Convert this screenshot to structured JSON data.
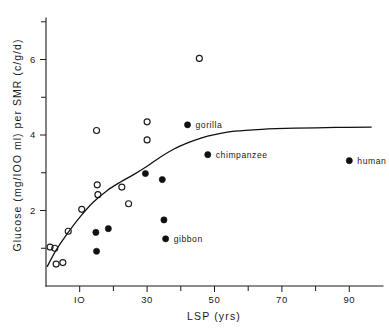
{
  "chart_data": {
    "type": "scatter",
    "title": "",
    "xlabel": "LSP (yrs)",
    "ylabel": "Glucose  (mg/IOO ml)  per SMR  (c/g/d)",
    "xlim": [
      0,
      100
    ],
    "ylim": [
      0,
      7.1
    ],
    "x_ticks_major": [
      10,
      30,
      50,
      70,
      90
    ],
    "x_ticks_major_labels": [
      "IO",
      "30",
      "50",
      "70",
      "90"
    ],
    "x_ticks_minor": [
      20,
      40,
      60,
      80
    ],
    "y_ticks_major": [
      2,
      4,
      6
    ],
    "y_ticks_major_labels": [
      "2",
      "4",
      "6"
    ],
    "y_ticks_minor": [
      1,
      3,
      5,
      7
    ],
    "grid": false,
    "legend_position": "none",
    "series": [
      {
        "name": "open-circle-species",
        "marker": "open-circle",
        "points": [
          {
            "x": 1.2,
            "y": 1.03
          },
          {
            "x": 2.6,
            "y": 1.0
          },
          {
            "x": 3.0,
            "y": 0.58
          },
          {
            "x": 5.0,
            "y": 0.62
          },
          {
            "x": 6.6,
            "y": 1.45
          },
          {
            "x": 10.6,
            "y": 2.03
          },
          {
            "x": 15.0,
            "y": 4.12
          },
          {
            "x": 15.2,
            "y": 2.68
          },
          {
            "x": 15.4,
            "y": 2.42
          },
          {
            "x": 22.5,
            "y": 2.62
          },
          {
            "x": 24.5,
            "y": 2.18
          },
          {
            "x": 30.0,
            "y": 4.35
          },
          {
            "x": 30.0,
            "y": 3.87
          },
          {
            "x": 45.5,
            "y": 6.03
          }
        ]
      },
      {
        "name": "filled-circle-species",
        "marker": "filled-circle",
        "points": [
          {
            "x": 14.8,
            "y": 1.42
          },
          {
            "x": 15.0,
            "y": 0.92
          },
          {
            "x": 18.5,
            "y": 1.52
          },
          {
            "x": 29.5,
            "y": 2.98
          },
          {
            "x": 34.5,
            "y": 2.82
          },
          {
            "x": 35.0,
            "y": 1.75
          },
          {
            "x": 35.5,
            "y": 1.25
          },
          {
            "x": 42.0,
            "y": 4.27
          },
          {
            "x": 48.0,
            "y": 3.48
          },
          {
            "x": 90.0,
            "y": 3.32
          }
        ]
      }
    ],
    "annotations": [
      {
        "label": "gorilla",
        "x": 42.0,
        "y": 4.27
      },
      {
        "label": "chimpanzee",
        "x": 48.0,
        "y": 3.48
      },
      {
        "label": "human",
        "x": 90.0,
        "y": 3.32
      },
      {
        "label": "gibbon",
        "x": 35.5,
        "y": 1.25
      }
    ],
    "fit_curve": {
      "name": "saturating-fit",
      "description": "rising curve flattening near 4.2",
      "points": [
        {
          "x": 0.4,
          "y": 0.52
        },
        {
          "x": 3.0,
          "y": 0.95
        },
        {
          "x": 6.0,
          "y": 1.35
        },
        {
          "x": 10.0,
          "y": 1.82
        },
        {
          "x": 14.0,
          "y": 2.22
        },
        {
          "x": 18.0,
          "y": 2.52
        },
        {
          "x": 22.0,
          "y": 2.75
        },
        {
          "x": 26.0,
          "y": 2.95
        },
        {
          "x": 30.0,
          "y": 3.17
        },
        {
          "x": 34.0,
          "y": 3.42
        },
        {
          "x": 38.0,
          "y": 3.63
        },
        {
          "x": 42.0,
          "y": 3.79
        },
        {
          "x": 46.0,
          "y": 3.92
        },
        {
          "x": 50.0,
          "y": 4.01
        },
        {
          "x": 56.0,
          "y": 4.1
        },
        {
          "x": 64.0,
          "y": 4.15
        },
        {
          "x": 74.0,
          "y": 4.18
        },
        {
          "x": 86.0,
          "y": 4.2
        },
        {
          "x": 96.5,
          "y": 4.21
        }
      ]
    }
  }
}
